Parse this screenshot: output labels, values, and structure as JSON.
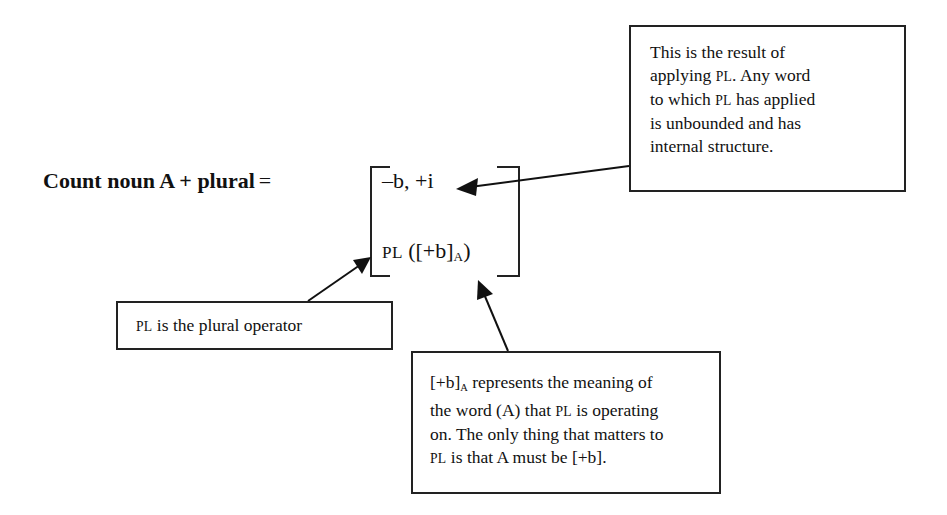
{
  "title": {
    "bold_text": "Count noun A + plural",
    "equals": "="
  },
  "matrix": {
    "row1": "–b, +i",
    "row2": {
      "operator": "PL",
      "open": " ([+b]",
      "subscript": "A",
      "close": ")"
    }
  },
  "callouts": {
    "result": {
      "lines": [
        {
          "pre": "This is the result of",
          "sc": "",
          "post": ""
        },
        {
          "pre": "applying ",
          "sc": "PL",
          "post": ". Any word"
        },
        {
          "pre": "to which ",
          "sc": "PL",
          "post": " has applied"
        },
        {
          "pre": "is unbounded and has",
          "sc": "",
          "post": ""
        },
        {
          "pre": "internal structure.",
          "sc": "",
          "post": ""
        }
      ]
    },
    "operator": {
      "sc": "PL",
      "text": " is the plural operator"
    },
    "meaning": {
      "line1": {
        "pre": "[+b]",
        "sub": "A",
        "post": " represents the meaning of"
      },
      "line2": {
        "pre": "the word (A) that ",
        "sc": "PL",
        "post": " is operating"
      },
      "line3": {
        "pre": "on. The only thing that matters to"
      },
      "line4": {
        "sc": "PL",
        "post": " is that A must be [+b]."
      }
    }
  },
  "colors": {
    "ink": "#111111",
    "background": "#ffffff"
  }
}
